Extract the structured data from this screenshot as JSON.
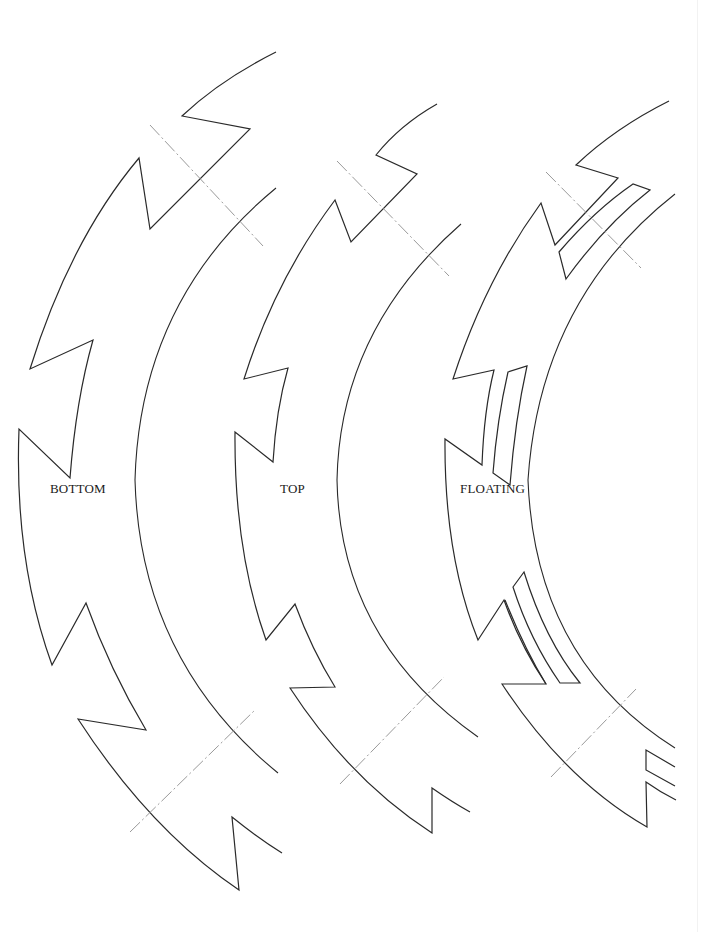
{
  "diagram": {
    "type": "template-pieces",
    "background": "#ffffff",
    "line_color": "#2a2a2a",
    "cut_line_color": "#9a9a9a",
    "pieces": [
      {
        "id": "bottom",
        "label": "BOTTOM",
        "has_slots": false
      },
      {
        "id": "top",
        "label": "TOP",
        "has_slots": false
      },
      {
        "id": "floating",
        "label": "FLOATING",
        "has_slots": true
      }
    ]
  }
}
